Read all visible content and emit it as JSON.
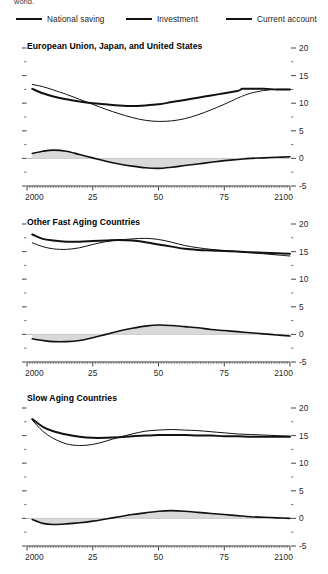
{
  "fragment_text": "world.",
  "legend": {
    "items": [
      {
        "label": "National saving",
        "style": "thin",
        "color": "#111111"
      },
      {
        "label": "Investment",
        "style": "thick",
        "color": "#111111"
      },
      {
        "label": "Current account",
        "style": "med",
        "color": "#111111"
      }
    ]
  },
  "chart_data": [
    {
      "type": "line",
      "title": "European Union, Japan, and United States",
      "xlabel": "",
      "ylabel": "",
      "xlim": [
        2000,
        2100
      ],
      "ylim": [
        -5,
        20
      ],
      "xticks": [
        2000,
        2025,
        2050,
        2075,
        2100
      ],
      "xticklabels": [
        "2000",
        "25",
        "50",
        "75",
        "2100"
      ],
      "yticks": [
        -5,
        0,
        5,
        10,
        15,
        20
      ],
      "yticklabels": [
        "-5",
        "0",
        "5",
        "10",
        "15",
        "20"
      ],
      "grid": false,
      "legend_position": "top-outside",
      "x": [
        2002,
        2006,
        2010,
        2015,
        2020,
        2025,
        2030,
        2035,
        2040,
        2045,
        2050,
        2055,
        2060,
        2065,
        2070,
        2075,
        2080,
        2082,
        2085,
        2090,
        2095,
        2100
      ],
      "series": [
        {
          "name": "National saving",
          "style": "thin",
          "values": [
            13.4,
            13.0,
            12.4,
            11.6,
            10.7,
            9.8,
            8.9,
            8.1,
            7.4,
            6.9,
            6.7,
            6.8,
            7.2,
            7.9,
            8.8,
            9.8,
            10.9,
            11.3,
            11.8,
            12.3,
            12.5,
            12.5
          ]
        },
        {
          "name": "Investment",
          "style": "thick",
          "values": [
            12.6,
            11.8,
            11.2,
            10.7,
            10.3,
            10.0,
            9.8,
            9.6,
            9.5,
            9.6,
            9.8,
            10.2,
            10.6,
            11.0,
            11.4,
            11.8,
            12.2,
            12.6,
            12.6,
            12.6,
            12.5,
            12.5
          ]
        },
        {
          "name": "Current account",
          "style": "med",
          "fill": true,
          "values": [
            0.9,
            1.3,
            1.5,
            1.3,
            0.7,
            0.1,
            -0.5,
            -1.0,
            -1.4,
            -1.7,
            -1.8,
            -1.6,
            -1.3,
            -1.0,
            -0.7,
            -0.4,
            -0.2,
            -0.1,
            0.0,
            0.1,
            0.2,
            0.3
          ]
        }
      ]
    },
    {
      "type": "line",
      "title": "Other Fast Aging Countries",
      "xlabel": "",
      "ylabel": "",
      "xlim": [
        2000,
        2100
      ],
      "ylim": [
        -5,
        20
      ],
      "xticks": [
        2000,
        2025,
        2050,
        2075,
        2100
      ],
      "xticklabels": [
        "2000",
        "25",
        "50",
        "75",
        "2100"
      ],
      "yticks": [
        -5,
        0,
        5,
        10,
        15,
        20
      ],
      "yticklabels": [
        "-5",
        "0",
        "5",
        "10",
        "15",
        "20"
      ],
      "grid": false,
      "legend_position": "top-outside",
      "x": [
        2002,
        2006,
        2010,
        2015,
        2020,
        2025,
        2030,
        2035,
        2040,
        2045,
        2050,
        2055,
        2060,
        2065,
        2070,
        2075,
        2080,
        2085,
        2090,
        2095,
        2100
      ],
      "series": [
        {
          "name": "National saving",
          "style": "thin",
          "values": [
            16.6,
            15.9,
            15.5,
            15.4,
            15.7,
            16.3,
            16.8,
            17.1,
            17.3,
            17.4,
            17.2,
            16.7,
            16.1,
            15.7,
            15.4,
            15.2,
            15.0,
            14.8,
            14.6,
            14.4,
            14.2
          ]
        },
        {
          "name": "Investment",
          "style": "thick",
          "values": [
            18.1,
            17.3,
            17.0,
            16.8,
            16.8,
            16.9,
            17.0,
            17.1,
            17.0,
            16.7,
            16.3,
            15.9,
            15.5,
            15.3,
            15.2,
            15.1,
            15.0,
            14.9,
            14.8,
            14.7,
            14.6
          ]
        },
        {
          "name": "Current account",
          "style": "med",
          "fill": true,
          "values": [
            -0.8,
            -1.1,
            -1.3,
            -1.3,
            -1.1,
            -0.6,
            0.0,
            0.6,
            1.1,
            1.5,
            1.7,
            1.6,
            1.4,
            1.2,
            0.9,
            0.7,
            0.5,
            0.3,
            0.1,
            -0.1,
            -0.3
          ]
        }
      ]
    },
    {
      "type": "line",
      "title": "Slow Aging Countries",
      "xlabel": "",
      "ylabel": "",
      "xlim": [
        2000,
        2100
      ],
      "ylim": [
        -5,
        20
      ],
      "xticks": [
        2000,
        2025,
        2050,
        2075,
        2100
      ],
      "xticklabels": [
        "2000",
        "25",
        "50",
        "75",
        "2100"
      ],
      "yticks": [
        -5,
        0,
        5,
        10,
        15,
        20
      ],
      "yticklabels": [
        "-5",
        "0",
        "5",
        "10",
        "15",
        "20"
      ],
      "grid": false,
      "legend_position": "top-outside",
      "x": [
        2002,
        2006,
        2010,
        2015,
        2020,
        2025,
        2030,
        2035,
        2040,
        2045,
        2050,
        2055,
        2060,
        2065,
        2070,
        2075,
        2080,
        2085,
        2090,
        2095,
        2100
      ],
      "series": [
        {
          "name": "National saving",
          "style": "thin",
          "values": [
            17.8,
            15.8,
            14.5,
            13.5,
            13.2,
            13.4,
            14.0,
            14.7,
            15.3,
            15.8,
            16.0,
            16.1,
            16.0,
            15.9,
            15.7,
            15.5,
            15.3,
            15.2,
            15.1,
            15.0,
            14.9
          ]
        },
        {
          "name": "Investment",
          "style": "thick",
          "values": [
            18.0,
            16.6,
            15.8,
            15.2,
            14.8,
            14.6,
            14.6,
            14.7,
            14.9,
            15.0,
            15.1,
            15.1,
            15.1,
            15.0,
            15.0,
            14.9,
            14.9,
            14.8,
            14.8,
            14.8,
            14.8
          ]
        },
        {
          "name": "Current account",
          "style": "med",
          "fill": true,
          "values": [
            -0.2,
            -0.9,
            -1.1,
            -1.0,
            -0.8,
            -0.5,
            -0.1,
            0.3,
            0.7,
            1.0,
            1.3,
            1.4,
            1.3,
            1.1,
            0.9,
            0.7,
            0.5,
            0.3,
            0.2,
            0.1,
            0.0
          ]
        }
      ]
    }
  ]
}
